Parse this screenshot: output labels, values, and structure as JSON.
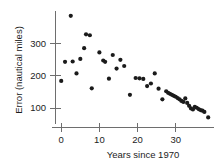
{
  "chart_data": {
    "type": "scatter",
    "title": "",
    "subtitle": "",
    "xlabel": "Years since 1970",
    "ylabel": "Error (nautical miles)",
    "xlim": [
      -1.5,
      39.5
    ],
    "ylim": [
      40,
      400
    ],
    "xticks": [
      0,
      10,
      20,
      30
    ],
    "xticklabels": [
      "0",
      "10",
      "20",
      "30"
    ],
    "yticks": [
      100,
      200,
      300
    ],
    "yticklabels": [
      "100",
      "200",
      "300"
    ],
    "grid": false,
    "legend": null,
    "annotations": [],
    "series": [
      {
        "name": "Navigation error",
        "marker": "circle",
        "color": "#1b1b1b",
        "points": [
          [
            0,
            184
          ],
          [
            1,
            243
          ],
          [
            2.5,
            385
          ],
          [
            3,
            244
          ],
          [
            4,
            207
          ],
          [
            5,
            252
          ],
          [
            6,
            285
          ],
          [
            6.5,
            328
          ],
          [
            7.5,
            325
          ],
          [
            8,
            161
          ],
          [
            10,
            272
          ],
          [
            11,
            247
          ],
          [
            11.5,
            243
          ],
          [
            12.5,
            191
          ],
          [
            13.5,
            264
          ],
          [
            14.5,
            222
          ],
          [
            15.5,
            249
          ],
          [
            16.5,
            230
          ],
          [
            18,
            141
          ],
          [
            19.5,
            193
          ],
          [
            20.5,
            192
          ],
          [
            21.5,
            190
          ],
          [
            22.5,
            168
          ],
          [
            23.5,
            176
          ],
          [
            24.5,
            207
          ],
          [
            25.5,
            160
          ],
          [
            26.5,
            127
          ],
          [
            27.5,
            152
          ],
          [
            28,
            147
          ],
          [
            28.5,
            144
          ],
          [
            29,
            141
          ],
          [
            29.5,
            138
          ],
          [
            30,
            135
          ],
          [
            30.5,
            131
          ],
          [
            31,
            127
          ],
          [
            31.5,
            122
          ],
          [
            32,
            119
          ],
          [
            32.5,
            130
          ],
          [
            33,
            116
          ],
          [
            33.5,
            107
          ],
          [
            34,
            99
          ],
          [
            34.5,
            96
          ],
          [
            35,
            104
          ],
          [
            35.5,
            101
          ],
          [
            36,
            97
          ],
          [
            36.5,
            94
          ],
          [
            37,
            92
          ],
          [
            37.5,
            88
          ],
          [
            38.5,
            71
          ]
        ]
      }
    ]
  },
  "axes": {
    "y_axis_label": "Error (nautical miles)",
    "x_axis_label": "Years since 1970"
  }
}
